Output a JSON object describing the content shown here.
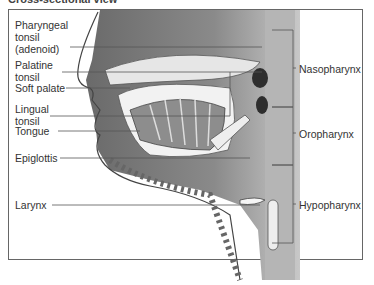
{
  "title": "Cross-sectional view",
  "left_labels": [
    {
      "line1": "Pharyngeal",
      "line2": "tonsil",
      "line3": "(adenoid)"
    },
    {
      "line1": "Palatine",
      "line2": "tonsil"
    },
    {
      "line1": "Soft palate"
    },
    {
      "line1": "Lingual",
      "line2": "tonsil"
    },
    {
      "line1": "Tongue"
    },
    {
      "line1": "Epiglottis"
    },
    {
      "line1": "Larynx"
    }
  ],
  "right_labels": [
    "Nasopharynx",
    "Oropharynx",
    "Hypopharynx"
  ],
  "colors": {
    "line": "#555555",
    "tissue_dark": "#5a5a5a",
    "tissue_mid": "#9a9a9a",
    "tissue_light": "#d0d0d0"
  }
}
